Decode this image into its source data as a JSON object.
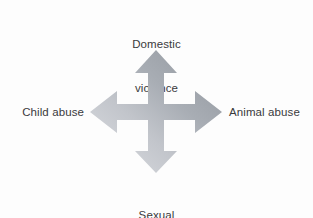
{
  "figure": {
    "type": "four-way-arrow-diagram",
    "background_color": "#fdfdfd",
    "text_color": "#3a3a3c"
  },
  "labels": {
    "top": {
      "name": "domestic-violence",
      "line1": "Domestic",
      "line2": "violence"
    },
    "left": {
      "name": "child-abuse",
      "text": "Child abuse"
    },
    "right": {
      "name": "animal-abuse",
      "text": "Animal abuse"
    },
    "bottom": {
      "name": "sexual-abuse",
      "line1": "Sexual",
      "line2": "abuse"
    }
  },
  "arrows": {
    "icon": "four-way-arrow-icon",
    "directions": [
      "up",
      "right",
      "down",
      "left"
    ],
    "gradient": {
      "from_color": "#8f949b",
      "mid_color": "#b4b8bf",
      "to_color": "#dcdee2",
      "direction": "top-right to bottom-left"
    }
  }
}
